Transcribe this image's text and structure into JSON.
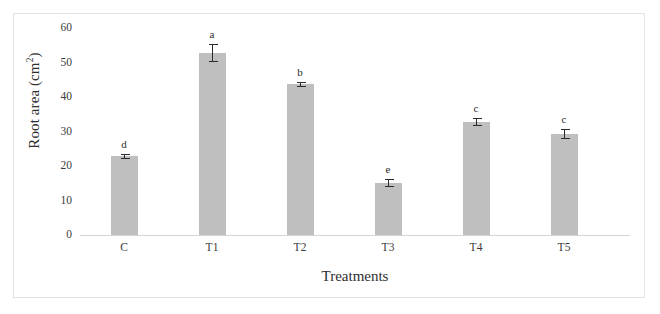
{
  "figure": {
    "frame_border_color": "#e2e2e2",
    "background_color": "#ffffff"
  },
  "chart_data": {
    "type": "bar",
    "title": "",
    "subtitle": "",
    "xlabel": "Treatments",
    "ylabel": "Root area (cm2)",
    "ylabel_base": "Root area (cm",
    "ylabel_sup": "2",
    "ylabel_tail": ")",
    "categories": [
      "C",
      "T1",
      "T2",
      "T3",
      "T4",
      "T5"
    ],
    "values": [
      22.8,
      52.7,
      43.7,
      15.0,
      32.8,
      29.2
    ],
    "errors": [
      0.8,
      2.6,
      0.7,
      1.2,
      1.1,
      1.5
    ],
    "annotations": [
      "d",
      "a",
      "b",
      "e",
      "c",
      "c"
    ],
    "series": [
      {
        "name": "Root area",
        "values": [
          22.8,
          52.7,
          43.7,
          15.0,
          32.8,
          29.2
        ]
      }
    ],
    "yticks": [
      0,
      10,
      20,
      30,
      40,
      50,
      60
    ],
    "ytick_labels": [
      "0",
      "10",
      "20",
      "30",
      "40",
      "50",
      "60"
    ],
    "ylim": [
      0,
      60
    ],
    "grid": false,
    "legend": null,
    "legend_position": "none",
    "bar_color": "#bfbfbf",
    "error_bar_color": "#2b2b2b",
    "axis_color": "#d5d5d5"
  }
}
